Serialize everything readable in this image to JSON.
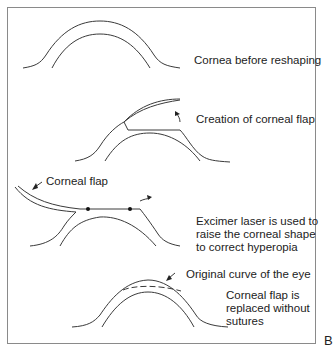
{
  "diagram": {
    "panel_letter": "B",
    "steps": [
      {
        "label": "Cornea before reshaping"
      },
      {
        "label": "Creation of corneal flap"
      },
      {
        "label": "Excimer laser is used to\nraise the corneal shape\nto correct hyperopia",
        "flap_label": "Corneal flap"
      },
      {
        "label": "Corneal flap is\nreplaced without\nsutures",
        "annotation": "Original curve of the eye"
      }
    ],
    "colors": {
      "line": "#3a3a3a",
      "border": "#8a8a8a",
      "text": "#222222"
    }
  }
}
